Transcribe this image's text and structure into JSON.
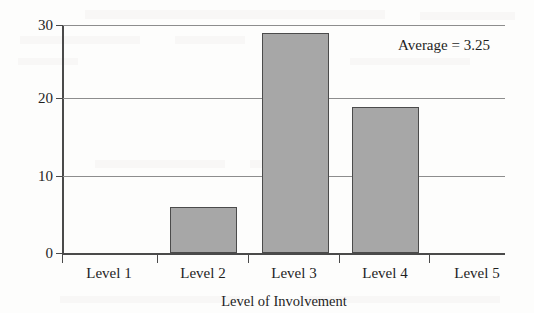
{
  "chart_data": {
    "type": "bar",
    "title": "",
    "subtitle": "",
    "categories": [
      "Level 1",
      "Level 2",
      "Level 3",
      "Level 4",
      "Level 5"
    ],
    "values": [
      0,
      6,
      29,
      19.2,
      0
    ],
    "series": [
      {
        "name": "No. of incidences",
        "values": [
          0,
          6,
          29,
          19.2,
          0
        ]
      }
    ],
    "xlabel": "Level of Involvement",
    "ylabel": "No. of incidences",
    "ylim": [
      0,
      30
    ],
    "yticks": [
      0,
      10,
      20,
      30
    ],
    "ytick_labels": [
      "0",
      "10",
      "20",
      "30"
    ],
    "grid": "horizontal",
    "legend": "none",
    "annotations": [
      {
        "text": "Average = 3.25",
        "position": "top-right"
      }
    ],
    "colors": {
      "bar_fill": "#a7a7a7",
      "bar_edge": "#4b4b4b",
      "gridline": "#8d8d8d",
      "axis": "#4a4a4a",
      "background": "#fdfdfc",
      "text": "#1f1f1f"
    }
  },
  "axes": {
    "y_title": "No. of incidences",
    "x_title": "Level of Involvement",
    "y_labels": [
      "0",
      "10",
      "20",
      "30"
    ],
    "x_labels": [
      "Level 1",
      "Level 2",
      "Level 3",
      "Level 4",
      "Level 5"
    ]
  },
  "annotation": {
    "average_text": "Average = 3.25"
  }
}
